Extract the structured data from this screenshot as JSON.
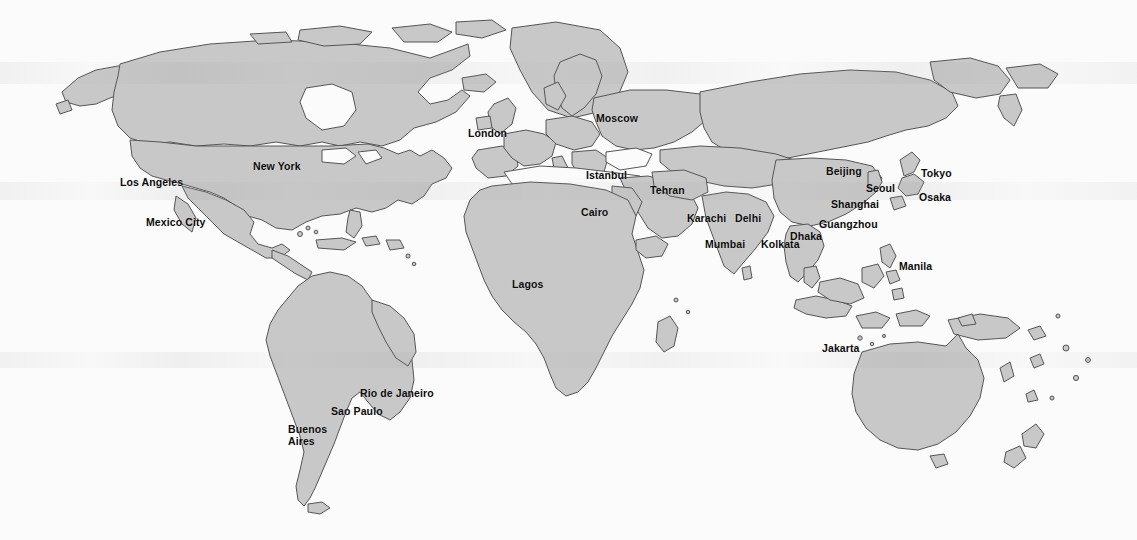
{
  "map": {
    "title": "World Map with Major Cities",
    "projection": "world",
    "colors": {
      "land_fill": "#c8c8c8",
      "land_border": "#555555",
      "ocean": "#fbfbfb",
      "label_text": "#0b0b0b",
      "page_background": "#ffffff"
    },
    "label_count": 27,
    "cities": [
      {
        "name": "Los Angeles",
        "x": 120,
        "y": 177
      },
      {
        "name": "New York",
        "x": 253,
        "y": 161
      },
      {
        "name": "Mexico City",
        "x": 146,
        "y": 217
      },
      {
        "name": "Rio de Janeiro",
        "x": 360,
        "y": 388
      },
      {
        "name": "Sao Paulo",
        "x": 331,
        "y": 406
      },
      {
        "name": "Buenos",
        "x": 288,
        "y": 424
      },
      {
        "name": "Aires",
        "x": 288,
        "y": 436
      },
      {
        "name": "London",
        "x": 468,
        "y": 128
      },
      {
        "name": "Moscow",
        "x": 596,
        "y": 113
      },
      {
        "name": "Istanbul",
        "x": 586,
        "y": 170
      },
      {
        "name": "Cairo",
        "x": 581,
        "y": 207
      },
      {
        "name": "Tehran",
        "x": 650,
        "y": 185
      },
      {
        "name": "Lagos",
        "x": 512,
        "y": 279
      },
      {
        "name": "Karachi",
        "x": 687,
        "y": 213
      },
      {
        "name": "Delhi",
        "x": 735,
        "y": 213
      },
      {
        "name": "Mumbai",
        "x": 705,
        "y": 239
      },
      {
        "name": "Kolkata",
        "x": 761,
        "y": 239
      },
      {
        "name": "Dhaka",
        "x": 790,
        "y": 231
      },
      {
        "name": "Beijing",
        "x": 826,
        "y": 166
      },
      {
        "name": "Seoul",
        "x": 866,
        "y": 183
      },
      {
        "name": "Shanghai",
        "x": 831,
        "y": 199
      },
      {
        "name": "Guangzhou",
        "x": 819,
        "y": 219
      },
      {
        "name": "Tokyo",
        "x": 921,
        "y": 168
      },
      {
        "name": "Osaka",
        "x": 919,
        "y": 192
      },
      {
        "name": "Manila",
        "x": 899,
        "y": 261
      },
      {
        "name": "Jakarta",
        "x": 822,
        "y": 343
      }
    ]
  }
}
